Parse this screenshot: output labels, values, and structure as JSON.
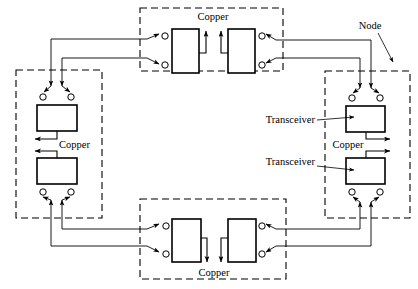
{
  "diagram": {
    "type": "network-topology",
    "canvas": {
      "width": 418,
      "height": 289,
      "background": "#ffffff"
    },
    "colors": {
      "line": "#000000",
      "node_border": "#000000",
      "box_fill": "#ffffff"
    },
    "labels": {
      "node": "Node",
      "transceiver_upper": "Transceiver",
      "transceiver_lower": "Transceiver",
      "copper_top": "Copper",
      "copper_bottom": "Copper",
      "copper_left": "Copper",
      "copper_right": "Copper"
    },
    "nodes": [
      {
        "id": "top",
        "name": "top-node",
        "orientation": "horizontal",
        "transceivers": 2,
        "medium": "Copper",
        "x": 140,
        "y": 8,
        "w": 143,
        "h": 63
      },
      {
        "id": "left",
        "name": "left-node",
        "orientation": "vertical",
        "transceivers": 2,
        "medium": "Copper",
        "x": 16,
        "y": 70,
        "w": 86,
        "h": 148
      },
      {
        "id": "right",
        "name": "right-node",
        "orientation": "vertical",
        "transceivers": 2,
        "medium": "Copper",
        "x": 325,
        "y": 71,
        "w": 85,
        "h": 147
      },
      {
        "id": "bottom",
        "name": "bottom-node",
        "orientation": "horizontal",
        "transceivers": 2,
        "medium": "Copper",
        "x": 140,
        "y": 199,
        "w": 146,
        "h": 80
      }
    ],
    "connector_count": 16,
    "link_count": 8
  }
}
